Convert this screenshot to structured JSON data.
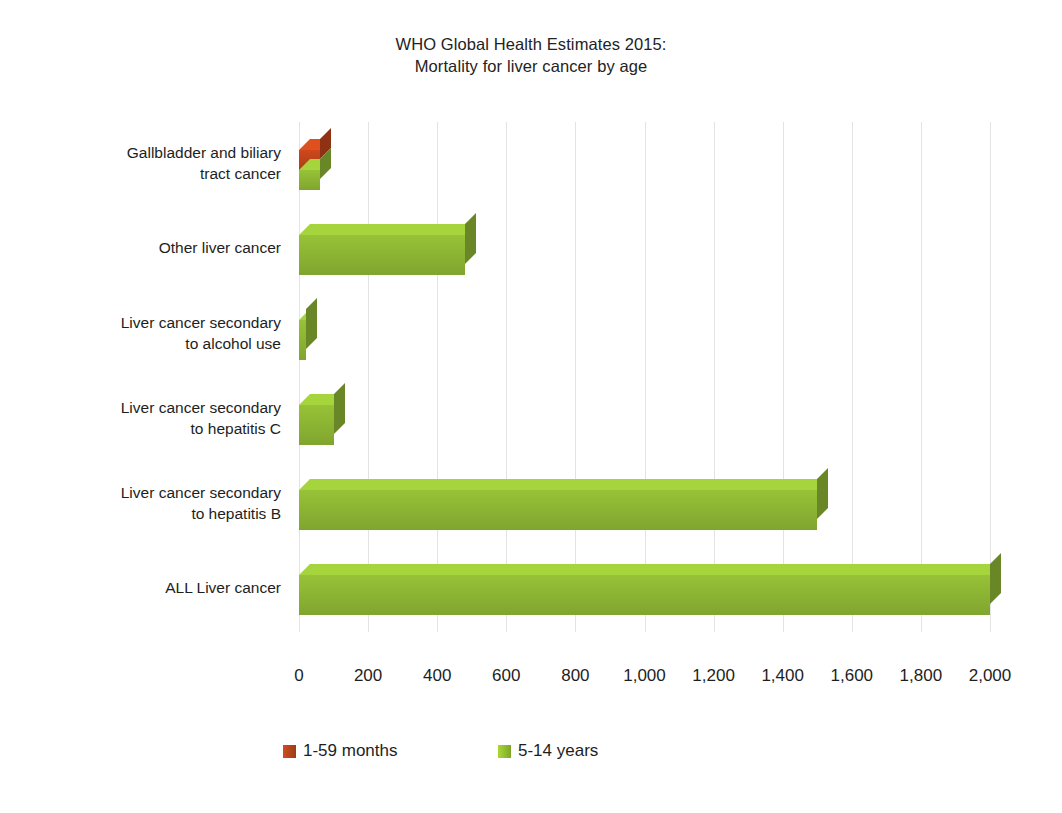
{
  "chart": {
    "title_line1": "WHO Global Health Estimates 2015:",
    "title_line2": "Mortality for liver cancer by age"
  },
  "chart_data": {
    "type": "bar",
    "orientation": "horizontal",
    "style": "3d-clustered-bar",
    "title": "WHO Global Health Estimates 2015: Mortality for liver cancer by age",
    "xlabel": "",
    "ylabel": "",
    "xlim": [
      0,
      2000
    ],
    "grid": true,
    "gridlines_axis": "x",
    "legend_position": "bottom-left",
    "categories": [
      "Gallbladder and biliary tract cancer",
      "Other liver cancer",
      "Liver cancer secondary to alcohol use",
      "Liver cancer secondary to hepatitis C",
      "Liver cancer secondary to hepatitis B",
      "ALL Liver cancer"
    ],
    "category_label_lines": [
      [
        "Gallbladder and biliary",
        "tract cancer"
      ],
      [
        "Other liver cancer"
      ],
      [
        "Liver cancer secondary",
        "to alcohol use"
      ],
      [
        "Liver cancer secondary",
        "to hepatitis C"
      ],
      [
        "Liver cancer secondary",
        "to hepatitis B"
      ],
      [
        "ALL Liver cancer"
      ]
    ],
    "series": [
      {
        "name": "1-59 months",
        "color": "#c1441a",
        "values": [
          60,
          0,
          0,
          0,
          0,
          0
        ]
      },
      {
        "name": "5-14 years",
        "color": "#8eb734",
        "values": [
          60,
          480,
          20,
          100,
          1500,
          2000
        ]
      }
    ],
    "x_ticks": [
      0,
      200,
      400,
      600,
      800,
      1000,
      1200,
      1400,
      1600,
      1800,
      2000
    ],
    "x_tick_labels": [
      "0",
      "200",
      "400",
      "600",
      "800",
      "1,000",
      "1,200",
      "1,400",
      "1,600",
      "1,800",
      "2,000"
    ]
  },
  "legend": {
    "items": [
      {
        "label": "1-59 months",
        "color": "#b9451c"
      },
      {
        "label": "5-14 years",
        "color": "#95c22e"
      }
    ]
  }
}
